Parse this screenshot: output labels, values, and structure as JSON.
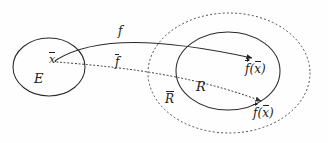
{
  "figure": {
    "type": "math-set-mapping-diagram",
    "background_color": "#fefefe",
    "ink_color": "#222222"
  },
  "shapes": {
    "domain_ellipse": {
      "name": "E",
      "stroke": "solid",
      "cx": 49,
      "cy": 67,
      "rx": 36,
      "ry": 29
    },
    "codomain_ellipse": {
      "name": "R",
      "stroke": "solid",
      "cx": 228,
      "cy": 71,
      "rx": 52,
      "ry": 39
    },
    "closure_ellipse": {
      "name": "R-bar",
      "stroke": "dotted",
      "cx": 229,
      "cy": 73,
      "rx": 81,
      "ry": 60
    }
  },
  "points": {
    "x_bar": {
      "x": 55,
      "y": 61
    }
  },
  "arrows": {
    "solid_map": {
      "style": "solid",
      "from": {
        "x": 56,
        "y": 60
      },
      "to": {
        "x": 254,
        "y": 59
      },
      "label": "f",
      "target_label": "f(x̄)"
    },
    "dotted_map": {
      "style": "dotted",
      "from": {
        "x": 56,
        "y": 62
      },
      "to": {
        "x": 263,
        "y": 102
      },
      "label": "f̄",
      "target_label": "f̄(x̄)"
    }
  },
  "labels": {
    "set_E": "E",
    "point_x": "x",
    "point_x_accent": "bar",
    "map_f_solid": "f",
    "map_f_dotted": "f",
    "map_f_dotted_accent": "bar",
    "set_R": "R",
    "set_R_closure": "R",
    "set_R_closure_accent": "bar",
    "image_solid_fn": "f",
    "image_solid_fn_accent": "arrow",
    "image_solid_open": "(",
    "image_solid_arg": "x",
    "image_solid_arg_accent": "bar",
    "image_solid_close": ")",
    "image_dotted_fn": "f",
    "image_dotted_fn_accent": "arrow",
    "image_dotted_open": "(",
    "image_dotted_arg": "x",
    "image_dotted_arg_accent": "bar",
    "image_dotted_close": ")"
  }
}
